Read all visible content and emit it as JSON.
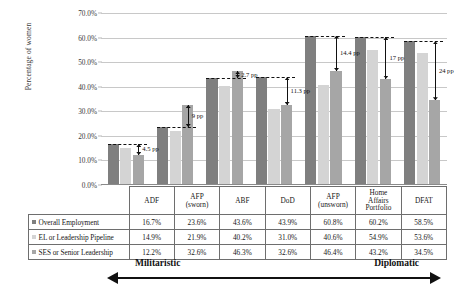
{
  "chart_data": {
    "type": "bar",
    "title": "",
    "xlabel": "",
    "ylabel": "Percentage of women",
    "ylim": [
      0,
      70
    ],
    "ytick_labels": [
      "0.0%",
      "10.0%",
      "20.0%",
      "30.0%",
      "40.0%",
      "50.0%",
      "60.0%",
      "70.0%"
    ],
    "ytick_values": [
      0,
      10,
      20,
      30,
      40,
      50,
      60,
      70
    ],
    "grid": true,
    "legend_position": "table-row-labels",
    "categories": [
      "ADF",
      "AFP (sworn)",
      "ABF",
      "DoD",
      "AFP (unsworn)",
      "Home Affairs Portfolio",
      "DFAT"
    ],
    "series": [
      {
        "name": "Overall Employment",
        "color": "#7f7f7f",
        "values": [
          16.7,
          23.6,
          43.6,
          43.9,
          60.8,
          60.2,
          58.5
        ],
        "labels": [
          "16.7%",
          "23.6%",
          "43.6%",
          "43.9%",
          "60.8%",
          "60.2%",
          "58.5%"
        ]
      },
      {
        "name": "EL or Leadership Pipeline",
        "color": "#d4d4d4",
        "values": [
          14.9,
          21.9,
          40.2,
          31.0,
          40.6,
          54.9,
          53.6
        ],
        "labels": [
          "14.9%",
          "21.9%",
          "40.2%",
          "31.0%",
          "40.6%",
          "54.9%",
          "53.6%"
        ]
      },
      {
        "name": "SES or Senior Leadership",
        "color": "#a6a6a6",
        "values": [
          12.2,
          32.6,
          46.3,
          32.6,
          46.4,
          43.2,
          34.5
        ],
        "labels": [
          "12.2%",
          "32.6%",
          "46.3%",
          "32.6%",
          "46.4%",
          "43.2%",
          "34.5%"
        ]
      }
    ],
    "annotations": [
      {
        "category": "ADF",
        "label": "4.5 pp",
        "from": 16.7,
        "to": 12.2
      },
      {
        "category": "AFP (sworn)",
        "label": "9 pp",
        "from": 23.6,
        "to": 32.6
      },
      {
        "category": "ABF",
        "label": "2.7 pp",
        "from": 43.6,
        "to": 46.3
      },
      {
        "category": "DoD",
        "label": "11.3 pp",
        "from": 43.9,
        "to": 32.6
      },
      {
        "category": "AFP (unsworn)",
        "label": "14.4 pp",
        "from": 60.8,
        "to": 46.4
      },
      {
        "category": "Home Affairs Portfolio",
        "label": "17 pp",
        "from": 60.2,
        "to": 43.2
      },
      {
        "category": "DFAT",
        "label": "24 pp",
        "from": 58.5,
        "to": 34.5
      }
    ]
  },
  "table": {
    "corner_label": "",
    "column_headers": [
      "ADF",
      "AFP\n(sworn)",
      "ABF",
      "DoD",
      "AFP\n(unsworn)",
      "Home\nAffairs\nPortfolio",
      "DFAT"
    ],
    "column_headers_lines": [
      [
        "ADF"
      ],
      [
        "AFP",
        "(sworn)"
      ],
      [
        "ABF"
      ],
      [
        "DoD"
      ],
      [
        "AFP",
        "(unsworn)"
      ],
      [
        "Home",
        "Affairs",
        "Portfolio"
      ],
      [
        "DFAT"
      ]
    ],
    "rows": [
      {
        "label": "Overall Employment",
        "marker_color": "#7f7f7f",
        "values": [
          "16.7%",
          "23.6%",
          "43.6%",
          "43.9%",
          "60.8%",
          "60.2%",
          "58.5%"
        ]
      },
      {
        "label": "EL or Leadership Pipeline",
        "marker_color": "#d4d4d4",
        "values": [
          "14.9%",
          "21.9%",
          "40.2%",
          "31.0%",
          "40.6%",
          "54.9%",
          "53.6%"
        ]
      },
      {
        "label": "SES or Senior Leadership",
        "marker_color": "#a6a6a6",
        "values": [
          "12.2%",
          "32.6%",
          "46.3%",
          "32.6%",
          "46.4%",
          "43.2%",
          "34.5%"
        ]
      }
    ]
  },
  "spectrum": {
    "left_label": "Militaristic",
    "right_label": "Diplomatic"
  }
}
